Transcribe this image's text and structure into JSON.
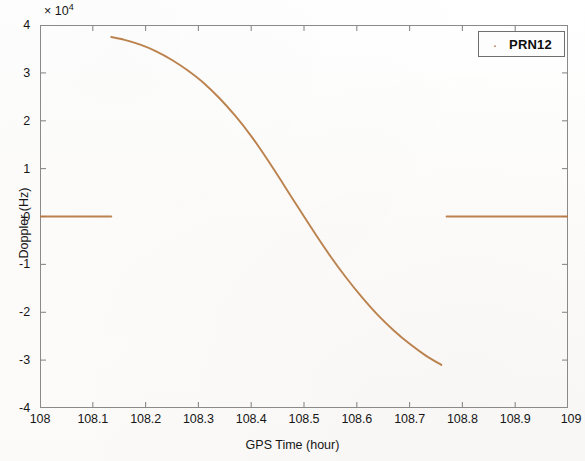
{
  "figure": {
    "background_color": "#fdfdfc",
    "axes_border_color": "#8a8a8a"
  },
  "axis": {
    "exponent_prefix": "× 10",
    "exponent_power": "4",
    "xlabel": "GPS Time (hour)",
    "ylabel": "Doppler (Hz)"
  },
  "legend": {
    "marker_glyph": "·",
    "entries": [
      {
        "label": "PRN12",
        "color": "#b5773f"
      }
    ]
  },
  "chart_data": {
    "type": "line",
    "title": "",
    "xlabel": "GPS Time (hour)",
    "ylabel": "Doppler (Hz)",
    "y_scale_exponent": 4,
    "y_scale_note": "y tick labels are in units of 1e4 Hz",
    "xlim": [
      108,
      109
    ],
    "ylim": [
      -40000,
      40000
    ],
    "xticks": [
      108,
      108.1,
      108.2,
      108.3,
      108.4,
      108.5,
      108.6,
      108.7,
      108.8,
      108.9,
      109
    ],
    "xtick_labels": [
      "108",
      "108.1",
      "108.2",
      "108.3",
      "108.4",
      "108.5",
      "108.6",
      "108.7",
      "108.8",
      "108.9",
      "109"
    ],
    "yticks": [
      -40000,
      -30000,
      -20000,
      -10000,
      0,
      10000,
      20000,
      30000,
      40000
    ],
    "ytick_labels": [
      "-4",
      "-3",
      "-2",
      "-1",
      "0",
      "1",
      "2",
      "3",
      "4"
    ],
    "grid": false,
    "legend_position": "top-right",
    "series": [
      {
        "name": "PRN12",
        "color": "#b5773f",
        "marker": "dot",
        "segments": [
          {
            "name": "zero-baseline-left",
            "x": [
              108.0,
              108.02,
              108.04,
              108.06,
              108.08,
              108.1,
              108.12,
              108.135
            ],
            "y": [
              0,
              0,
              0,
              0,
              0,
              0,
              0,
              0
            ]
          },
          {
            "name": "doppler-pass",
            "x": [
              108.135,
              108.16,
              108.19,
              108.22,
              108.25,
              108.28,
              108.31,
              108.34,
              108.37,
              108.4,
              108.43,
              108.46,
              108.49,
              108.52,
              108.55,
              108.58,
              108.61,
              108.64,
              108.67,
              108.7,
              108.73,
              108.76
            ],
            "y": [
              37500,
              36900,
              35900,
              34500,
              32700,
              30500,
              27900,
              24700,
              21000,
              16800,
              12000,
              6900,
              1700,
              -3400,
              -8300,
              -12800,
              -16900,
              -20600,
              -23800,
              -26600,
              -29000,
              -31000
            ]
          },
          {
            "name": "zero-baseline-right",
            "x": [
              108.77,
              108.8,
              108.83,
              108.86,
              108.89,
              108.92,
              108.95,
              108.98,
              109.0
            ],
            "y": [
              0,
              0,
              0,
              0,
              0,
              0,
              0,
              0,
              0
            ]
          }
        ]
      }
    ],
    "annotations": [
      {
        "text": "curve starts near x=108.13 at about +3.75e4 Hz"
      },
      {
        "text": "curve crosses zero near x=108.49"
      },
      {
        "text": "curve ends near x=108.76 at about -3.2e4 Hz"
      }
    ]
  }
}
